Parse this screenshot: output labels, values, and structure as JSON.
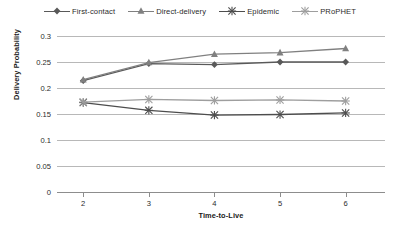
{
  "chart_data": {
    "type": "line",
    "title": "",
    "xlabel": "Time-to-Live",
    "ylabel": "Delivery Probability",
    "x": [
      2,
      3,
      4,
      5,
      6
    ],
    "categories": [
      "2",
      "3",
      "4",
      "5",
      "6"
    ],
    "xlim": [
      1.6,
      6.6
    ],
    "ylim": [
      0,
      0.3
    ],
    "yticks": [
      0,
      0.05,
      0.1,
      0.15,
      0.2,
      0.25,
      0.3
    ],
    "ytick_labels": [
      "0",
      "0.05",
      "0.1",
      "0.15",
      "0.2",
      "0.25",
      "0.3"
    ],
    "grid": true,
    "legend_position": "top-center",
    "series": [
      {
        "name": "First-contact",
        "marker": "diamond",
        "color": "#595959",
        "values": [
          0.214,
          0.247,
          0.245,
          0.25,
          0.25
        ]
      },
      {
        "name": "Direct-delivery",
        "marker": "triangle",
        "color": "#808080",
        "values": [
          0.216,
          0.249,
          0.265,
          0.268,
          0.276
        ]
      },
      {
        "name": "Epidemic",
        "marker": "cross",
        "color": "#4d4d4d",
        "values": [
          0.172,
          0.157,
          0.148,
          0.149,
          0.152
        ]
      },
      {
        "name": "PRoPHET",
        "marker": "cross",
        "color": "#9e9e9e",
        "values": [
          0.173,
          0.178,
          0.176,
          0.177,
          0.175
        ]
      }
    ]
  },
  "style": {
    "grid_color": "#b8b8b8",
    "axis_color": "#8d8d8d",
    "background": "#ffffff",
    "text_color": "#2b2b2b"
  }
}
